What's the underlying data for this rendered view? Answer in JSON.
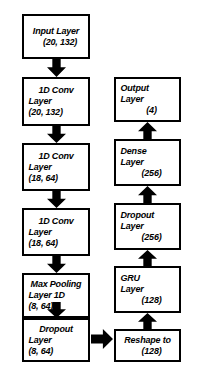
{
  "diagram": {
    "colors": {
      "stroke": "#000000",
      "fill": "#ffffff",
      "arrow": "#000000"
    },
    "left_column": [
      {
        "id": "input-layer",
        "lines": [
          "Input Layer",
          "(20, 132)"
        ],
        "shape": "(20, 132)"
      },
      {
        "id": "conv1d-1",
        "lines": [
          "1D Conv",
          "Layer",
          "(20, 132)"
        ],
        "shape": "(20, 132)"
      },
      {
        "id": "conv1d-2",
        "lines": [
          "1D Conv",
          "Layer",
          "(18, 64)"
        ],
        "shape": "(18, 64)"
      },
      {
        "id": "conv1d-3",
        "lines": [
          "1D Conv",
          "Layer",
          "(18, 64)"
        ],
        "shape": "(18, 64)"
      },
      {
        "id": "max-pooling-1d",
        "lines": [
          "Max Pooling",
          "Layer 1D",
          "(8, 64)"
        ],
        "shape": "(8, 64)"
      },
      {
        "id": "dropout-1",
        "lines": [
          "Dropout",
          "Layer",
          "(8, 64)"
        ],
        "shape": "(8, 64)"
      }
    ],
    "right_column": [
      {
        "id": "output-layer",
        "lines": [
          "Output",
          "Layer",
          "(4)"
        ],
        "shape": "(4)"
      },
      {
        "id": "dense-layer",
        "lines": [
          "Dense",
          "Layer",
          "(256)"
        ],
        "shape": "(256)"
      },
      {
        "id": "dropout-2",
        "lines": [
          "Dropout",
          "Layer",
          "(256)"
        ],
        "shape": "(256)"
      },
      {
        "id": "gru-layer",
        "lines": [
          "GRU",
          "Layer",
          "(128)"
        ],
        "shape": "(128)"
      },
      {
        "id": "reshape",
        "lines": [
          "Reshape to",
          "(128)"
        ],
        "shape": "(128)"
      }
    ],
    "arrows": [
      {
        "id": "arrow-input-to-conv1",
        "direction": "down"
      },
      {
        "id": "arrow-conv1-to-conv2",
        "direction": "down"
      },
      {
        "id": "arrow-conv2-to-conv3",
        "direction": "down"
      },
      {
        "id": "arrow-conv3-to-maxpool",
        "direction": "down"
      },
      {
        "id": "arrow-maxpool-to-dropout1",
        "direction": "down"
      },
      {
        "id": "arrow-dropout1-to-reshape",
        "direction": "right"
      },
      {
        "id": "arrow-reshape-to-gru",
        "direction": "up"
      },
      {
        "id": "arrow-gru-to-dropout2",
        "direction": "up"
      },
      {
        "id": "arrow-dropout2-to-dense",
        "direction": "up"
      },
      {
        "id": "arrow-dense-to-output",
        "direction": "up"
      }
    ]
  }
}
